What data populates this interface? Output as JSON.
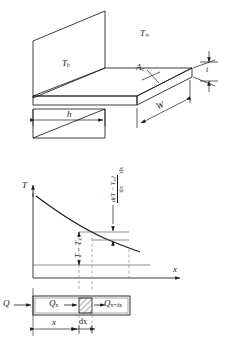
{
  "figure": {
    "stroke_color": "#1a1a1a",
    "dashed_color": "#777777",
    "background": "#ffffff"
  },
  "panel_fin": {
    "name": "fin-geometry-3d",
    "labels": {
      "ambient_temperature": "T",
      "ambient_temperature_sub": "∞",
      "base_temperature": "T",
      "base_temperature_sub": "b",
      "cross_section_area": "A",
      "cross_section_area_sub": "c",
      "width": "W",
      "length": "h",
      "thickness": "t"
    }
  },
  "panel_profile": {
    "name": "temperature-profile-graph",
    "axis": {
      "y_label": "T",
      "x_label": "x"
    },
    "annotations": {
      "excess_temperature": "T − T",
      "excess_temperature_sub": "∞",
      "derivative_numerator": "d(T − T",
      "derivative_numerator_sub": "∞",
      "derivative_numerator_tail": ")",
      "derivative_denominator": "dx",
      "derivative_multiplier": "dx"
    }
  },
  "panel_control_volume": {
    "name": "control-volume-energy-balance",
    "labels": {
      "heat_in": "Q",
      "conduction_in": "Q",
      "conduction_in_sub": "x",
      "conduction_out": "Q",
      "conduction_out_sub": "x+dx",
      "distance": "x",
      "element_width": "dx"
    }
  }
}
